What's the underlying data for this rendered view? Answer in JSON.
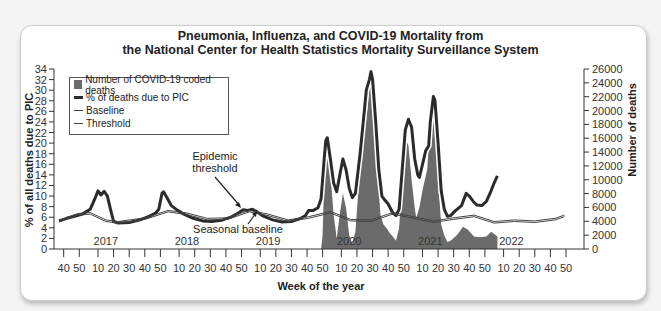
{
  "chart_data": {
    "type": "line",
    "title": "Pneumonia, Influenza, and COVID-19 Mortality from the National Center for Health Statistics Mortality Surveillance System",
    "title_lines": [
      "Pneumonia, Influenza, and COVID-19 Mortality from",
      "the National Center for Health Statistics Mortality Surveillance System"
    ],
    "xlabel": "Week of the year",
    "ylabel": "% of all deaths due to PIC",
    "y2label": "Number of deaths",
    "ylim": [
      0,
      34
    ],
    "y2lim": [
      0,
      26000
    ],
    "yticks": [
      0,
      2,
      4,
      6,
      8,
      10,
      12,
      14,
      16,
      18,
      20,
      22,
      24,
      26,
      28,
      30,
      32,
      34
    ],
    "y2ticks": [
      0,
      2000,
      4000,
      6000,
      8000,
      10000,
      12000,
      14000,
      16000,
      18000,
      20000,
      22000,
      24000,
      26000
    ],
    "xticks": [
      {
        "w": 3,
        "label": "40"
      },
      {
        "w": 13,
        "label": "50"
      },
      {
        "w": 25,
        "label": "10"
      },
      {
        "w": 35,
        "label": "20"
      },
      {
        "w": 45,
        "label": "30"
      },
      {
        "w": 55,
        "label": "40"
      },
      {
        "w": 65,
        "label": "50"
      },
      {
        "w": 77,
        "label": "10"
      },
      {
        "w": 87,
        "label": "20"
      },
      {
        "w": 97,
        "label": "30"
      },
      {
        "w": 107,
        "label": "40"
      },
      {
        "w": 117,
        "label": "50"
      },
      {
        "w": 129,
        "label": "10"
      },
      {
        "w": 139,
        "label": "20"
      },
      {
        "w": 149,
        "label": "30"
      },
      {
        "w": 159,
        "label": "40"
      },
      {
        "w": 169,
        "label": "50"
      },
      {
        "w": 181,
        "label": "10"
      },
      {
        "w": 191,
        "label": "20"
      },
      {
        "w": 201,
        "label": "30"
      },
      {
        "w": 211,
        "label": "40"
      },
      {
        "w": 221,
        "label": "50"
      },
      {
        "w": 233,
        "label": "10"
      },
      {
        "w": 243,
        "label": "20"
      },
      {
        "w": 253,
        "label": "30"
      },
      {
        "w": 263,
        "label": "40"
      },
      {
        "w": 273,
        "label": "50"
      },
      {
        "w": 285,
        "label": "10"
      },
      {
        "w": 295,
        "label": "20"
      },
      {
        "w": 305,
        "label": "30"
      },
      {
        "w": 315,
        "label": "40"
      },
      {
        "w": 325,
        "label": "50"
      }
    ],
    "year_labels": [
      {
        "w": 30,
        "label": "2017"
      },
      {
        "w": 82,
        "label": "2018"
      },
      {
        "w": 134,
        "label": "2019"
      },
      {
        "w": 186,
        "label": "2020"
      },
      {
        "w": 238,
        "label": "2021"
      },
      {
        "w": 290,
        "label": "2022"
      }
    ],
    "legend": [
      {
        "label": "Number of COVID-19 coded deaths",
        "style": "area",
        "color": "#6b6b6b"
      },
      {
        "label": "% of deaths due to PIC",
        "style": "thick-line",
        "color": "#2b2b2b"
      },
      {
        "label": "Baseline",
        "style": "thin-line",
        "color": "#444444"
      },
      {
        "label": "Threshold",
        "style": "thin-line",
        "color": "#444444"
      }
    ],
    "legend_position": "upper-left",
    "grid": false,
    "annotations": [
      {
        "text_lines": [
          "Epidemic",
          "threshold"
        ],
        "points_to": "threshold near week 115"
      },
      {
        "text": "Seasonal baseline",
        "points_to": "baseline near week 121"
      }
    ],
    "series": [
      {
        "name": "% of deaths due to PIC",
        "axis": "left",
        "points": [
          [
            0,
            5.3
          ],
          [
            5,
            5.8
          ],
          [
            10,
            6.2
          ],
          [
            15,
            6.6
          ],
          [
            20,
            7.5
          ],
          [
            23,
            9.5
          ],
          [
            25,
            11.0
          ],
          [
            27,
            10.2
          ],
          [
            29,
            10.9
          ],
          [
            31,
            10.0
          ],
          [
            33,
            7.5
          ],
          [
            35,
            5.2
          ],
          [
            38,
            4.9
          ],
          [
            45,
            5.0
          ],
          [
            52,
            5.5
          ],
          [
            58,
            6.2
          ],
          [
            62,
            6.8
          ],
          [
            64,
            7.5
          ],
          [
            66,
            10.5
          ],
          [
            67,
            10.8
          ],
          [
            69,
            9.8
          ],
          [
            72,
            8.2
          ],
          [
            76,
            7.3
          ],
          [
            80,
            6.6
          ],
          [
            86,
            5.8
          ],
          [
            92,
            5.3
          ],
          [
            98,
            5.2
          ],
          [
            105,
            5.5
          ],
          [
            110,
            6.0
          ],
          [
            115,
            6.8
          ],
          [
            118,
            7.4
          ],
          [
            121,
            7.3
          ],
          [
            124,
            7.5
          ],
          [
            127,
            7.0
          ],
          [
            131,
            6.2
          ],
          [
            137,
            5.5
          ],
          [
            143,
            5.1
          ],
          [
            149,
            5.2
          ],
          [
            155,
            5.8
          ],
          [
            158,
            6.3
          ],
          [
            160,
            7.3
          ],
          [
            163,
            7.3
          ],
          [
            166,
            7.8
          ],
          [
            168,
            9.5
          ],
          [
            170,
            17.0
          ],
          [
            171,
            20.5
          ],
          [
            172,
            21.0
          ],
          [
            174,
            17.0
          ],
          [
            176,
            12.5
          ],
          [
            178,
            10.8
          ],
          [
            180,
            14.0
          ],
          [
            182,
            17.0
          ],
          [
            184,
            15.0
          ],
          [
            186,
            11.5
          ],
          [
            188,
            9.7
          ],
          [
            190,
            10.5
          ],
          [
            193,
            18.0
          ],
          [
            196,
            27.0
          ],
          [
            197,
            30.0
          ],
          [
            199,
            32.0
          ],
          [
            200,
            33.5
          ],
          [
            201,
            32.0
          ],
          [
            203,
            24.0
          ],
          [
            205,
            15.0
          ],
          [
            207,
            10.0
          ],
          [
            209,
            9.2
          ],
          [
            211,
            8.5
          ],
          [
            214,
            6.8
          ],
          [
            216,
            6.3
          ],
          [
            218,
            7.5
          ],
          [
            220,
            15.0
          ],
          [
            222,
            22.5
          ],
          [
            224,
            24.5
          ],
          [
            226,
            23.0
          ],
          [
            228,
            17.0
          ],
          [
            230,
            14.0
          ],
          [
            231,
            13.5
          ],
          [
            233,
            16.0
          ],
          [
            235,
            18.5
          ],
          [
            237,
            19.5
          ],
          [
            238,
            24.0
          ],
          [
            240,
            28.8
          ],
          [
            241,
            28.0
          ],
          [
            243,
            20.0
          ],
          [
            245,
            11.0
          ],
          [
            247,
            7.5
          ],
          [
            249,
            6.2
          ],
          [
            251,
            6.3
          ],
          [
            254,
            7.2
          ],
          [
            258,
            8.2
          ],
          [
            261,
            10.5
          ],
          [
            263,
            10.0
          ],
          [
            266,
            8.8
          ],
          [
            268,
            8.3
          ],
          [
            271,
            8.2
          ],
          [
            274,
            9.0
          ],
          [
            277,
            11.0
          ],
          [
            279,
            12.5
          ],
          [
            281,
            13.8
          ]
        ]
      },
      {
        "name": "Baseline",
        "axis": "left",
        "points": [
          [
            0,
            5.1
          ],
          [
            12,
            6.4
          ],
          [
            20,
            6.6
          ],
          [
            30,
            5.2
          ],
          [
            38,
            4.9
          ],
          [
            55,
            5.6
          ],
          [
            70,
            7.0
          ],
          [
            82,
            6.5
          ],
          [
            95,
            5.5
          ],
          [
            108,
            5.6
          ],
          [
            122,
            7.0
          ],
          [
            134,
            6.3
          ],
          [
            147,
            5.2
          ],
          [
            160,
            5.8
          ],
          [
            174,
            6.8
          ],
          [
            187,
            5.3
          ],
          [
            200,
            5.2
          ],
          [
            214,
            6.6
          ],
          [
            227,
            5.8
          ],
          [
            240,
            5.0
          ],
          [
            253,
            5.6
          ],
          [
            266,
            6.1
          ],
          [
            279,
            4.9
          ],
          [
            292,
            5.2
          ],
          [
            305,
            5.0
          ],
          [
            318,
            5.5
          ],
          [
            324,
            6.1
          ]
        ]
      },
      {
        "name": "Threshold",
        "axis": "left",
        "points": [
          [
            0,
            5.4
          ],
          [
            12,
            6.7
          ],
          [
            20,
            6.9
          ],
          [
            30,
            5.5
          ],
          [
            38,
            5.2
          ],
          [
            55,
            5.9
          ],
          [
            70,
            7.3
          ],
          [
            82,
            6.8
          ],
          [
            95,
            5.8
          ],
          [
            108,
            5.9
          ],
          [
            122,
            7.3
          ],
          [
            134,
            6.6
          ],
          [
            147,
            5.5
          ],
          [
            160,
            6.1
          ],
          [
            174,
            7.1
          ],
          [
            187,
            5.6
          ],
          [
            200,
            5.5
          ],
          [
            214,
            6.9
          ],
          [
            227,
            6.1
          ],
          [
            240,
            5.3
          ],
          [
            253,
            5.9
          ],
          [
            266,
            6.4
          ],
          [
            279,
            5.2
          ],
          [
            292,
            5.5
          ],
          [
            305,
            5.3
          ],
          [
            318,
            5.8
          ],
          [
            324,
            6.4
          ]
        ]
      },
      {
        "name": "Number of COVID-19 coded deaths",
        "axis": "right",
        "style": "area",
        "points": [
          [
            168,
            0
          ],
          [
            169,
            2000
          ],
          [
            170,
            10000
          ],
          [
            171,
            14000
          ],
          [
            172,
            16000
          ],
          [
            174,
            11000
          ],
          [
            176,
            5000
          ],
          [
            178,
            1500
          ],
          [
            180,
            5000
          ],
          [
            182,
            8000
          ],
          [
            184,
            6000
          ],
          [
            186,
            2000
          ],
          [
            188,
            800
          ],
          [
            190,
            2500
          ],
          [
            193,
            12000
          ],
          [
            196,
            17000
          ],
          [
            198,
            21000
          ],
          [
            200,
            25300
          ],
          [
            202,
            22000
          ],
          [
            204,
            12000
          ],
          [
            206,
            5000
          ],
          [
            208,
            3500
          ],
          [
            210,
            3000
          ],
          [
            212,
            2300
          ],
          [
            214,
            1800
          ],
          [
            216,
            1200
          ],
          [
            218,
            3000
          ],
          [
            220,
            10000
          ],
          [
            222,
            16000
          ],
          [
            224,
            15000
          ],
          [
            226,
            10000
          ],
          [
            228,
            6000
          ],
          [
            229,
            4500
          ],
          [
            231,
            6000
          ],
          [
            233,
            8500
          ],
          [
            236,
            11500
          ],
          [
            238,
            18000
          ],
          [
            240,
            22000
          ],
          [
            241,
            20000
          ],
          [
            243,
            10000
          ],
          [
            245,
            3500
          ],
          [
            247,
            2000
          ],
          [
            249,
            1000
          ],
          [
            251,
            1200
          ],
          [
            255,
            2000
          ],
          [
            259,
            3200
          ],
          [
            262,
            2800
          ],
          [
            266,
            1800
          ],
          [
            270,
            1700
          ],
          [
            274,
            1800
          ],
          [
            277,
            2500
          ],
          [
            280,
            2000
          ],
          [
            281,
            1800
          ],
          [
            281,
            0
          ]
        ]
      }
    ]
  }
}
